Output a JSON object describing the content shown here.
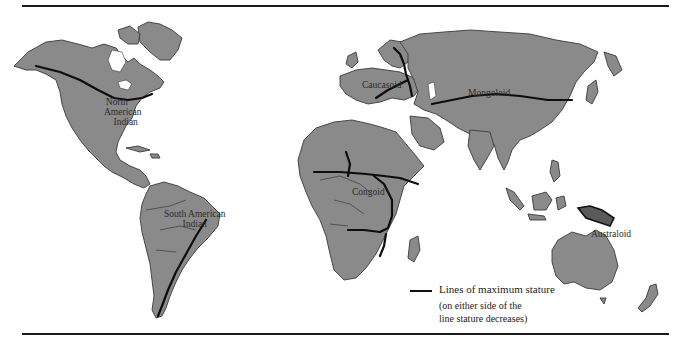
{
  "map": {
    "title": "",
    "regions": [
      {
        "id": "north-american-indian",
        "label_line1": "North",
        "label_line2": "American",
        "label_line3": "Indian"
      },
      {
        "id": "south-american-indian",
        "label_line1": "South American",
        "label_line2": "Indian"
      },
      {
        "id": "caucasoid",
        "label": "Caucasoid"
      },
      {
        "id": "mongoloid",
        "label": "Mongoloid"
      },
      {
        "id": "congoid",
        "label": "Congoid"
      },
      {
        "id": "australoid",
        "label": "Australoid"
      }
    ],
    "colors": {
      "land": "#8a8a8a",
      "stature_line": "#0d0d0d",
      "australoid_highlight": "#5a5a5a",
      "background": "#ffffff",
      "rule": "#1a1a1a"
    }
  },
  "legend": {
    "symbol": "black-line",
    "title": "Lines of maximum stature",
    "note_line1": "(on either side of the",
    "note_line2": "line stature decreases)"
  }
}
